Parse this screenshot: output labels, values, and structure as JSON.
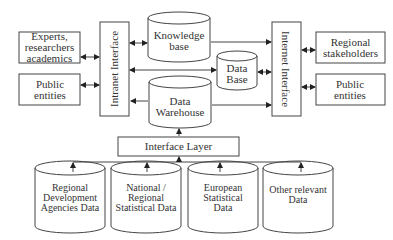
{
  "diagram": {
    "left_entities": [
      {
        "label": "Experts, researchers academics"
      },
      {
        "label": "Public entities"
      }
    ],
    "intranet_interface": "Intranet Interface",
    "internet_interface": "Internet Interface",
    "stores": {
      "knowledge_base": "Knowledge base",
      "data_base": "Data Base",
      "data_warehouse": "Data Warehouse"
    },
    "right_entities": [
      {
        "label": "Regional stakeholders"
      },
      {
        "label": "Public entities"
      }
    ],
    "interface_layer": "Interface Layer",
    "sources": [
      {
        "label": "Regional Development Agencies Data"
      },
      {
        "label": "National / Regional Statistical Data"
      },
      {
        "label": "European Statistical Data"
      },
      {
        "label": "Other relevant Data"
      }
    ],
    "colors": {
      "stroke": "#333333",
      "background": "#ffffff"
    }
  }
}
